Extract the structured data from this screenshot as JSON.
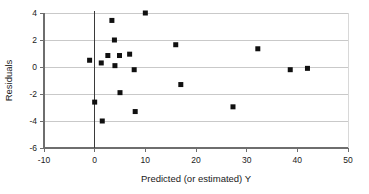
{
  "chart_data": {
    "type": "scatter",
    "title": "",
    "xlabel": "Predicted (or estimated) Y",
    "ylabel": "Residuals",
    "xlim": [
      -10,
      50
    ],
    "ylim": [
      -6,
      4
    ],
    "xticks": [
      -10,
      0,
      10,
      20,
      30,
      40,
      50
    ],
    "yticks": [
      4,
      2,
      0,
      -2,
      -4,
      -6
    ],
    "xtick_labels": [
      "-10",
      "0",
      "10",
      "20",
      "30",
      "40",
      "50"
    ],
    "ytick_labels": [
      "4",
      "2",
      "0",
      "-2",
      "-4",
      "-6"
    ],
    "grid": "horizontal",
    "legend": "none",
    "marker": "square",
    "marker_color": "#101010",
    "grid_color": "#c9c9c9",
    "axis_color": "#6e6e6e",
    "zero_line_x": 0,
    "points": [
      {
        "x": -1.0,
        "y": 0.5
      },
      {
        "x": 0.0,
        "y": -2.6
      },
      {
        "x": 1.3,
        "y": 0.3
      },
      {
        "x": 1.5,
        "y": -4.0
      },
      {
        "x": 2.6,
        "y": 0.85
      },
      {
        "x": 3.4,
        "y": 3.45
      },
      {
        "x": 3.9,
        "y": 2.0
      },
      {
        "x": 4.0,
        "y": 0.1
      },
      {
        "x": 4.9,
        "y": 0.85
      },
      {
        "x": 5.0,
        "y": -1.9
      },
      {
        "x": 6.9,
        "y": 0.95
      },
      {
        "x": 7.8,
        "y": -0.2
      },
      {
        "x": 8.0,
        "y": -3.3
      },
      {
        "x": 10.0,
        "y": 4.0
      },
      {
        "x": 16.0,
        "y": 1.65
      },
      {
        "x": 17.0,
        "y": -1.3
      },
      {
        "x": 27.3,
        "y": -2.95
      },
      {
        "x": 32.2,
        "y": 1.35
      },
      {
        "x": 38.6,
        "y": -0.2
      },
      {
        "x": 42.0,
        "y": -0.1
      }
    ]
  }
}
